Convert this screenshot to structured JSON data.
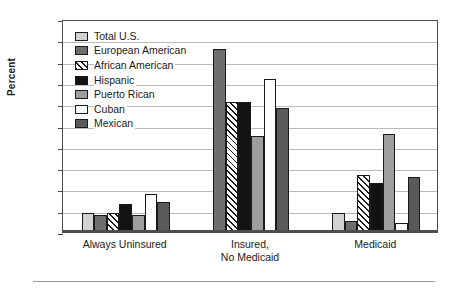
{
  "chart_data": {
    "type": "bar",
    "title": "",
    "xlabel": "",
    "ylabel": "Percent",
    "ylim": [
      0,
      100
    ],
    "yticks": [
      0,
      10,
      20,
      30,
      40,
      50,
      60,
      70,
      80,
      90,
      100
    ],
    "grid": true,
    "legend_position": "top-left inside plot",
    "categories": [
      "Always Uninsured",
      "Insured,\nNo Medicaid",
      "Medicaid"
    ],
    "series": [
      {
        "name": "Total U.S.",
        "swatch": "light-gray",
        "color": "#d2d2d2",
        "values": [
          9,
          null,
          9
        ]
      },
      {
        "name": "European American",
        "swatch": "dark-gray",
        "color": "#6e6e6e",
        "values": [
          8,
          86,
          5
        ]
      },
      {
        "name": "African American",
        "swatch": "diagonal-hatch",
        "color": "#ffffff",
        "values": [
          9,
          61,
          27
        ]
      },
      {
        "name": "Hispanic",
        "swatch": "black",
        "color": "#121212",
        "values": [
          13,
          61,
          23
        ]
      },
      {
        "name": "Puerto Rican",
        "swatch": "medium-gray",
        "color": "#9e9e9e",
        "values": [
          8,
          45,
          46
        ]
      },
      {
        "name": "Cuban",
        "swatch": "white",
        "color": "#ffffff",
        "values": [
          18,
          72,
          4
        ]
      },
      {
        "name": "Mexican",
        "swatch": "dark-gray",
        "color": "#5a5a5a",
        "values": [
          14,
          58,
          26
        ]
      }
    ]
  },
  "axis": {
    "y_title": "Percent"
  }
}
